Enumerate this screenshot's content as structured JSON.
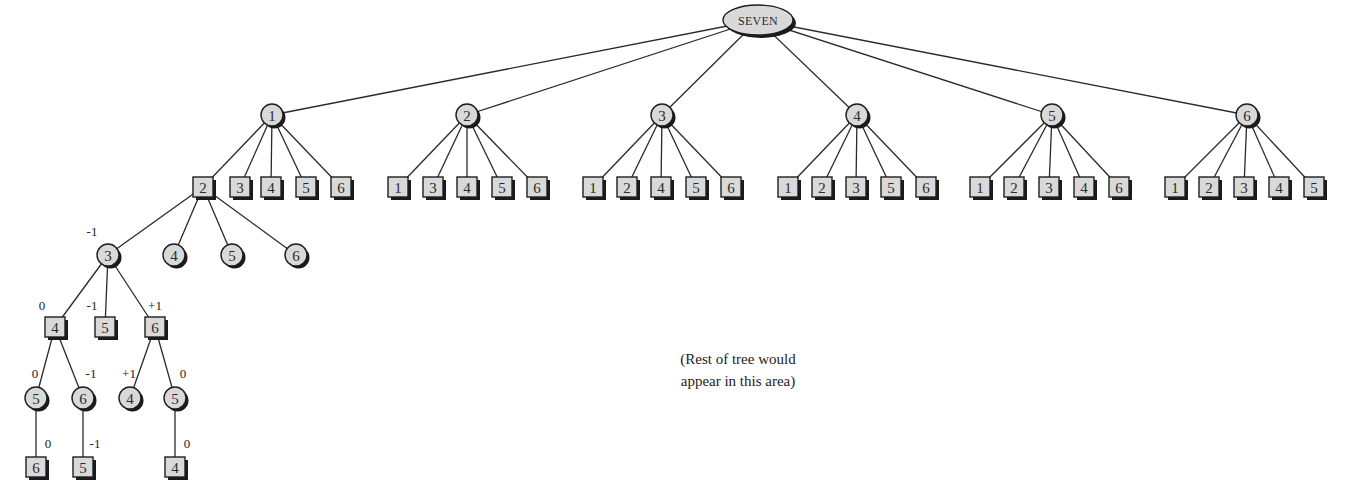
{
  "diagram": {
    "root": {
      "label": "SEVEN",
      "x": 758,
      "y": 20
    },
    "level1": [
      {
        "label": "1",
        "x": 272,
        "y": 115,
        "children": [
          {
            "label": "2",
            "x": 203
          },
          {
            "label": "3",
            "x": 240
          },
          {
            "label": "4",
            "x": 271
          },
          {
            "label": "5",
            "x": 306
          },
          {
            "label": "6",
            "x": 341
          }
        ]
      },
      {
        "label": "2",
        "x": 467,
        "y": 115,
        "children": [
          {
            "label": "1",
            "x": 398
          },
          {
            "label": "3",
            "x": 433
          },
          {
            "label": "4",
            "x": 467
          },
          {
            "label": "5",
            "x": 502
          },
          {
            "label": "6",
            "x": 537
          }
        ]
      },
      {
        "label": "3",
        "x": 662,
        "y": 115,
        "children": [
          {
            "label": "1",
            "x": 593
          },
          {
            "label": "2",
            "x": 627
          },
          {
            "label": "4",
            "x": 661
          },
          {
            "label": "5",
            "x": 696
          },
          {
            "label": "6",
            "x": 731
          }
        ]
      },
      {
        "label": "4",
        "x": 857,
        "y": 115,
        "children": [
          {
            "label": "1",
            "x": 788
          },
          {
            "label": "2",
            "x": 822
          },
          {
            "label": "3",
            "x": 856
          },
          {
            "label": "5",
            "x": 891
          },
          {
            "label": "6",
            "x": 926
          }
        ]
      },
      {
        "label": "5",
        "x": 1052,
        "y": 115,
        "children": [
          {
            "label": "1",
            "x": 980
          },
          {
            "label": "2",
            "x": 1014
          },
          {
            "label": "3",
            "x": 1049
          },
          {
            "label": "4",
            "x": 1084
          },
          {
            "label": "6",
            "x": 1119
          }
        ]
      },
      {
        "label": "6",
        "x": 1247,
        "y": 115,
        "children": [
          {
            "label": "1",
            "x": 1175
          },
          {
            "label": "2",
            "x": 1209
          },
          {
            "label": "3",
            "x": 1244
          },
          {
            "label": "4",
            "x": 1279
          },
          {
            "label": "5",
            "x": 1314
          }
        ]
      }
    ],
    "level2_y": 187,
    "expanded": {
      "parent": {
        "label": "2",
        "x": 203,
        "y": 187
      },
      "circles": [
        {
          "label": "3",
          "x": 108,
          "y": 255,
          "score": "-1"
        },
        {
          "label": "4",
          "x": 174,
          "y": 255,
          "score": ""
        },
        {
          "label": "5",
          "x": 232,
          "y": 255,
          "score": ""
        },
        {
          "label": "6",
          "x": 296,
          "y": 255,
          "score": ""
        }
      ],
      "level4": [
        {
          "label": "4",
          "x": 55,
          "y": 327,
          "score": "0",
          "shape": "square",
          "parent": 0
        },
        {
          "label": "5",
          "x": 105,
          "y": 327,
          "score": "-1",
          "shape": "square",
          "parent": 0
        },
        {
          "label": "6",
          "x": 155,
          "y": 327,
          "score": "+1",
          "shape": "square",
          "parent": 0
        }
      ],
      "level5": [
        {
          "label": "5",
          "x": 36,
          "y": 398,
          "score": "0",
          "shape": "circle",
          "parent": 0
        },
        {
          "label": "6",
          "x": 83,
          "y": 398,
          "score": "-1",
          "shape": "circle",
          "parent": 0
        },
        {
          "label": "4",
          "x": 130,
          "y": 398,
          "score": "+1",
          "shape": "circle",
          "parent": 2
        },
        {
          "label": "5",
          "x": 175,
          "y": 398,
          "score": "0",
          "shape": "circle",
          "parent": 2
        }
      ],
      "level6": [
        {
          "label": "6",
          "x": 36,
          "y": 467,
          "score": "0",
          "shape": "square",
          "parent": 0
        },
        {
          "label": "5",
          "x": 83,
          "y": 467,
          "score": "-1",
          "shape": "square",
          "parent": 1
        },
        {
          "label": "4",
          "x": 175,
          "y": 467,
          "score": "0",
          "shape": "square",
          "parent": 3
        }
      ]
    },
    "note": {
      "line1": "(Rest of tree would",
      "line2": "appear in this area)"
    },
    "colors": {
      "node_fill": "#d9d9d9",
      "node_stroke": "#1e1e1e",
      "shadow": "#1a1a1a",
      "edge": "#2a2a2a",
      "background": "#ffffff"
    }
  }
}
